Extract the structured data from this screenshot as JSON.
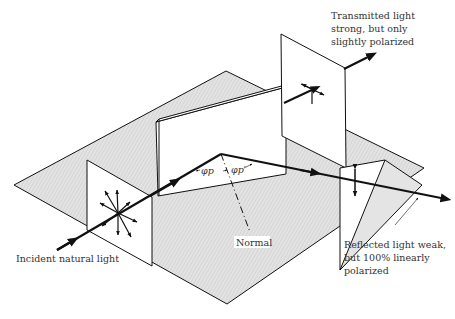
{
  "diagram": {
    "labels": {
      "transmitted": [
        "Transmitted light",
        "strong, but only",
        "slightly polarized"
      ],
      "reflected": [
        "Reflected light weak,",
        "but 100% linearly",
        "polarized"
      ],
      "incident": "Incident natural light",
      "normal": "Normal",
      "angle_incident": "φp",
      "angle_transmitted": "φp′"
    },
    "colors": {
      "ground_fill": "#dcdcdc",
      "line": "#111111",
      "screen_fill": "#ffffff",
      "reflect_screen_fill": "#e4e4e4"
    }
  }
}
